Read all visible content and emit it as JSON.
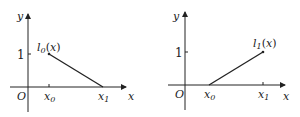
{
  "diagram": {
    "panels": [
      {
        "function_label": "l0(x)",
        "axis_x": "x",
        "axis_y": "y",
        "origin": "O",
        "tick_y": "1",
        "tick_x0": "x0",
        "tick_x1": "x1",
        "segment": {
          "from": [
            "x0",
            1
          ],
          "to": [
            "x1",
            0
          ]
        }
      },
      {
        "function_label": "l1(x)",
        "axis_x": "x",
        "axis_y": "y",
        "origin": "O",
        "tick_y": "1",
        "tick_x0": "x0",
        "tick_x1": "x1",
        "segment": {
          "from": [
            "x0",
            0
          ],
          "to": [
            "x1",
            1
          ]
        }
      }
    ],
    "colors": {
      "line": "#222222",
      "background": "#ffffff"
    }
  }
}
